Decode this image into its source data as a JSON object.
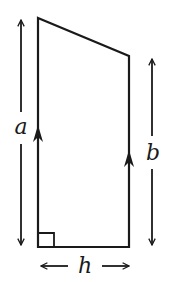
{
  "diagram": {
    "shape": "right trapezium",
    "labels": {
      "left_side": "a",
      "right_side": "b",
      "height": "h"
    },
    "colors": {
      "stroke": "#1a1a1a",
      "background": "#ffffff"
    },
    "annotations": {
      "right_angle_marker": true,
      "parallel_arrows": 2
    }
  }
}
